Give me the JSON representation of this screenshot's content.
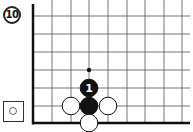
{
  "problem": {
    "number": "10"
  },
  "to_play": {
    "color": "white",
    "icon": "white-stone-icon"
  },
  "board": {
    "edges": [
      "left",
      "bottom"
    ],
    "columns_x": [
      33,
      52,
      71,
      89,
      108,
      127,
      145,
      164,
      182
    ],
    "rows_y": [
      16,
      34,
      52,
      70,
      88,
      106,
      123
    ],
    "grid_color": "#555555",
    "edge_color": "#111111"
  },
  "stones": [
    {
      "color": "black",
      "col": 3,
      "row": 4,
      "label": "1"
    },
    {
      "color": "black",
      "col": 3,
      "row": 5,
      "label": ""
    },
    {
      "color": "white",
      "col": 2,
      "row": 5,
      "label": ""
    },
    {
      "color": "white",
      "col": 4,
      "row": 5,
      "label": ""
    },
    {
      "color": "white",
      "col": 3,
      "row": 6,
      "label": ""
    }
  ],
  "marks": [
    {
      "type": "dot",
      "col": 3,
      "row": 3
    }
  ]
}
